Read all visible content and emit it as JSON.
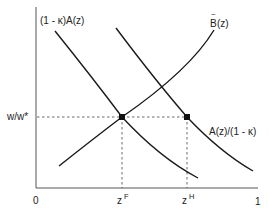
{
  "diagram": {
    "axes": {
      "y_label": "w/w*",
      "x_origin_label": "0",
      "x_end_label": "1",
      "colors": {
        "axis": "#555555",
        "curve": "#1a1a1a",
        "guide": "#444444"
      }
    },
    "curves": [
      {
        "id": "one-minus-kappa-A",
        "label": "(1 - κ)A(z)",
        "shape": "downward-sloping"
      },
      {
        "id": "A-over-one-minus-kappa",
        "label": "A(z)/(1 - κ)",
        "shape": "downward-sloping"
      },
      {
        "id": "B-tilde",
        "label_base": "B",
        "label_accent": "~",
        "label_suffix": "(z)",
        "shape": "upward-sloping"
      }
    ],
    "points": [
      {
        "id": "F",
        "x_label_base": "z",
        "x_label_sup": "F",
        "marker": "filled-dot"
      },
      {
        "id": "H",
        "x_label_base": "z",
        "x_label_sup": "H",
        "marker": "filled-dot"
      }
    ]
  }
}
